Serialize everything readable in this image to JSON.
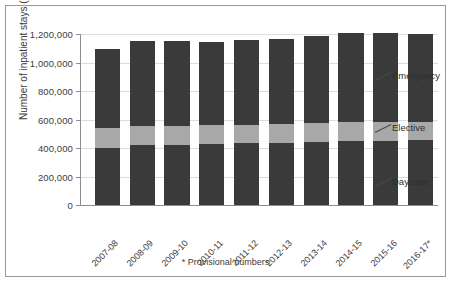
{
  "chart_data": {
    "type": "bar",
    "subtype": "stacked",
    "title": "",
    "xlabel": "",
    "ylabel": "Number of inpatient stays (CIS)",
    "ylim": [
      0,
      1200000
    ],
    "yticks": [
      0,
      200000,
      400000,
      600000,
      800000,
      1000000,
      1200000
    ],
    "ytick_labels": [
      "0",
      "200,000",
      "400,000",
      "600,000",
      "800,000",
      "1,000,000",
      "1,200,000"
    ],
    "grid": true,
    "legend_position": "right-callouts",
    "categories": [
      "2007-08",
      "2008-09",
      "2009-10",
      "2010-11",
      "2011-12",
      "2012-13",
      "2013-14",
      "2014-15",
      "2015-16",
      "2016-17*"
    ],
    "series": [
      {
        "name": "Daycase",
        "color": "#3a3a3a",
        "values": [
          400000,
          419000,
          422000,
          428000,
          433000,
          437000,
          443000,
          449000,
          452000,
          455000
        ]
      },
      {
        "name": "Elective",
        "color": "#a8a8a8",
        "values": [
          143000,
          136000,
          136000,
          133000,
          131000,
          133000,
          134000,
          131000,
          130000,
          128000
        ]
      },
      {
        "name": "Emergency",
        "color": "#3a3a3a",
        "values": [
          550000,
          594000,
          592000,
          583000,
          596000,
          595000,
          606000,
          627000,
          627000,
          617000
        ]
      }
    ],
    "totals": [
      1093000,
      1149000,
      1150000,
      1144000,
      1160000,
      1165000,
      1183000,
      1207000,
      1209000,
      1200000
    ],
    "annotations": {
      "footnote": "* Provisional numbers"
    }
  },
  "callouts": [
    {
      "label": "Emergency"
    },
    {
      "label": "Elective"
    },
    {
      "label": "Daycase"
    }
  ]
}
